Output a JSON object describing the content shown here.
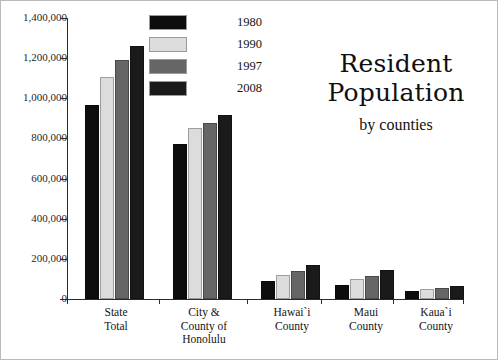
{
  "frame": {
    "border_color": "#b9b9b9",
    "background": "#ffffff"
  },
  "title": {
    "line1": "Resident",
    "line2": "Population",
    "subtitle": "by counties"
  },
  "legend": {
    "position": "top-center",
    "items": [
      {
        "label": "1980",
        "color": "#0d0d0d"
      },
      {
        "label": "1990",
        "color": "#dcdcdc"
      },
      {
        "label": "1997",
        "color": "#666666"
      },
      {
        "label": "2008",
        "color": "#1a1a1a"
      }
    ]
  },
  "axis": {
    "ylabel": "",
    "xlabel": "",
    "ytick_labels": [
      "1,400,000",
      "1,200,000",
      "1,000,000",
      "800,000",
      "600,000",
      "400,000",
      "200,000",
      "0"
    ]
  },
  "chart_data": {
    "type": "bar",
    "title": "Resident Population by counties",
    "subtitle": "by counties",
    "xlabel": "",
    "ylabel": "",
    "ylim": [
      0,
      1400000
    ],
    "ytick_step": 200000,
    "yticks": [
      0,
      200000,
      400000,
      600000,
      800000,
      1000000,
      1200000,
      1400000
    ],
    "grid": false,
    "legend_position": "top-center",
    "categories": [
      "State\nTotal",
      "City &\nCounty of\nHonolulu",
      "Hawai`i\nCounty",
      "Maui\nCounty",
      "Kaua`i\nCounty"
    ],
    "series": [
      {
        "name": "1980",
        "color": "#0d0d0d",
        "values": [
          965000,
          770000,
          92000,
          70000,
          39000
        ]
      },
      {
        "name": "1990",
        "color": "#dcdcdc",
        "values": [
          1108000,
          850000,
          120000,
          100000,
          51000
        ]
      },
      {
        "name": "1997",
        "color": "#666666",
        "values": [
          1190000,
          876000,
          140000,
          114000,
          57000
        ]
      },
      {
        "name": "2008",
        "color": "#1a1a1a",
        "values": [
          1260000,
          916000,
          171000,
          145000,
          66000
        ]
      }
    ]
  }
}
